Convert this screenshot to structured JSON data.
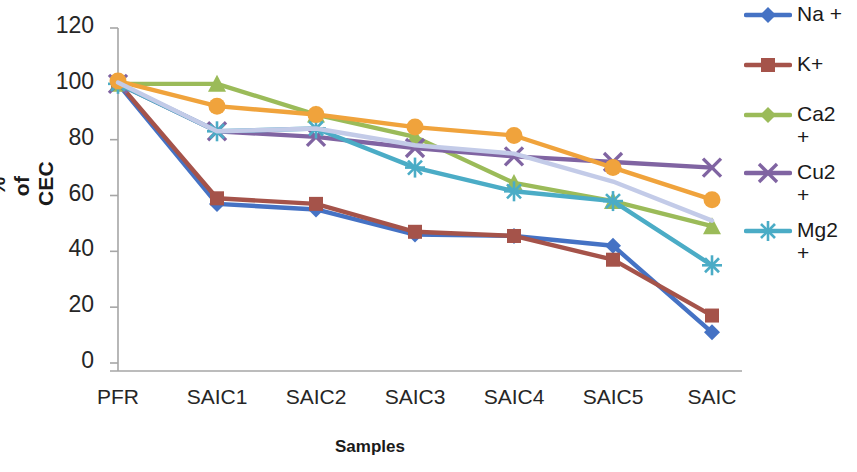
{
  "chart_data": {
    "type": "line",
    "title": "",
    "xlabel": "Samples",
    "ylabel": "% of CEC",
    "categories": [
      "PFR",
      "SAIC1",
      "SAIC2",
      "SAIC3",
      "SAIC4",
      "SAIC5",
      "SAIC"
    ],
    "ylim": [
      0,
      120
    ],
    "yticks": [
      0,
      20,
      40,
      60,
      80,
      100,
      120
    ],
    "grid": false,
    "legend_position": "right",
    "series": [
      {
        "name": "Na +",
        "label": "Na +",
        "color": "#4572c4",
        "marker": "diamond",
        "values": [
          100,
          57,
          55,
          46,
          45.5,
          42,
          11
        ]
      },
      {
        "name": "K+",
        "label": "K+",
        "color": "#a5534a",
        "marker": "square",
        "values": [
          100.5,
          59,
          57,
          47,
          45.5,
          37,
          17
        ]
      },
      {
        "name": "Ca2 +",
        "label": "Ca2\n+",
        "color": "#9bbb59",
        "marker": "triangle",
        "values": [
          100,
          100,
          89,
          81,
          64.5,
          58,
          49
        ]
      },
      {
        "name": "Cu2 +",
        "label": "Cu2\n+",
        "color": "#8064a2",
        "marker": "x",
        "values": [
          100,
          83,
          81,
          77,
          74,
          72,
          70
        ]
      },
      {
        "name": "Mg2 +",
        "label": "Mg2\n+",
        "color": "#4bacc6",
        "marker": "asterisk",
        "values": [
          100,
          83,
          84,
          70,
          61.5,
          58,
          35
        ]
      },
      {
        "name": "series-orange",
        "label": "",
        "color": "#f0a33c",
        "marker": "circle",
        "values": [
          101,
          92,
          89,
          84.5,
          81.5,
          70,
          58.5
        ]
      },
      {
        "name": "series-lavender",
        "label": "",
        "color": "#c3cbe8",
        "marker": "none",
        "values": [
          100.5,
          83,
          84,
          78,
          75,
          65,
          51
        ]
      }
    ]
  },
  "legend": {
    "entries": [
      {
        "label": "Na +",
        "color": "#4572c4",
        "marker": "diamond"
      },
      {
        "label": "K+",
        "color": "#a5534a",
        "marker": "square"
      },
      {
        "label": "Ca2\n+",
        "color": "#9bbb59",
        "marker": "diamond"
      },
      {
        "label": "Cu2\n+",
        "color": "#8064a2",
        "marker": "x"
      },
      {
        "label": "Mg2\n+",
        "color": "#4bacc6",
        "marker": "asterisk"
      }
    ]
  },
  "axes": {
    "y_axis_title": "% of CEC",
    "x_axis_title": "Samples",
    "y_tick_labels": [
      "120",
      "100",
      "80",
      "60",
      "40",
      "20",
      "0"
    ],
    "x_tick_labels": [
      "PFR",
      "SAIC1",
      "SAIC2",
      "SAIC3",
      "SAIC4",
      "SAIC5",
      "SAIC"
    ]
  },
  "colors": {
    "axis": "#a6a6a6",
    "text": "#262626"
  }
}
